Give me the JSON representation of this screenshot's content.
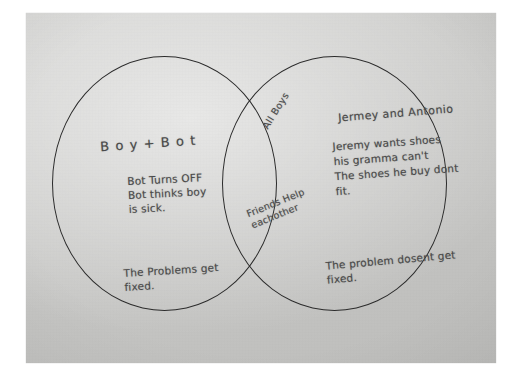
{
  "medium": {
    "surface": "grey construction paper",
    "writing_tool": "pencil",
    "paper_color": "#c9c9c7",
    "ink_color": "#4a4a4a",
    "line_color": "#2b2b2b"
  },
  "diagram": {
    "type": "venn",
    "set_count": 2,
    "left_set": {
      "title": "B o y + B o t",
      "body": "Bot Turns OFF\nBot thinks boy\nis sick.",
      "bottom": "The Problems get\n  fixed."
    },
    "overlap_set": {
      "title": "All Boys",
      "body": "Friends Help\n  eachother"
    },
    "right_set": {
      "title": "Jermey and Antonio",
      "body": "Jeremy wants shoes\nhis gramma can't\nThe shoes he buy dont\n   fit.",
      "bottom": "The problem dosent get\n  fixed."
    }
  }
}
